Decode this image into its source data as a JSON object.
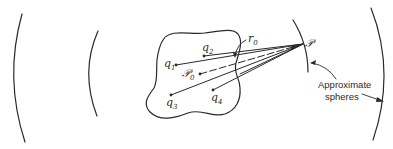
{
  "diagram": {
    "ink_color": "#2a2a2a",
    "background_color": "#ffffff",
    "charges": [
      {
        "id": "q1",
        "symbol": "q",
        "subscript": "1"
      },
      {
        "id": "q2",
        "symbol": "q",
        "subscript": "2"
      },
      {
        "id": "q3",
        "symbol": "q",
        "subscript": "3"
      },
      {
        "id": "q4",
        "symbol": "q",
        "subscript": "4"
      }
    ],
    "origin_point": {
      "symbol": "𝒫",
      "subscript": "0"
    },
    "field_point": {
      "symbol": "𝒫"
    },
    "distance_label": {
      "symbol": "r",
      "subscript": "0"
    },
    "annotation": {
      "line1": "Approximate",
      "line2": "spheres"
    }
  }
}
